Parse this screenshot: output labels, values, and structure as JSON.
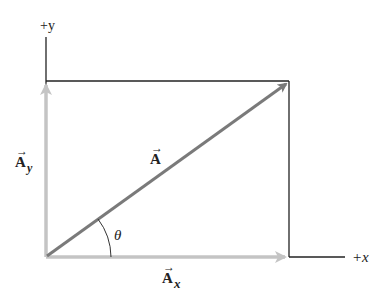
{
  "diagram": {
    "type": "vector-components",
    "axes": {
      "x_label": "+x",
      "y_label": "+y"
    },
    "vectors": {
      "A": {
        "label": "A",
        "arrow": "→",
        "color": "#7a7a7a"
      },
      "Ax": {
        "label": "A",
        "subscript": "x",
        "arrow": "→",
        "color": "#c4c4c4"
      },
      "Ay": {
        "label": "A",
        "subscript": "y",
        "arrow": "→",
        "color": "#c4c4c4"
      }
    },
    "angle": {
      "label": "θ"
    },
    "colors": {
      "axis_line": "#222222",
      "resultant": "#7a7a7a",
      "component": "#c4c4c4",
      "background": "#ffffff"
    }
  }
}
